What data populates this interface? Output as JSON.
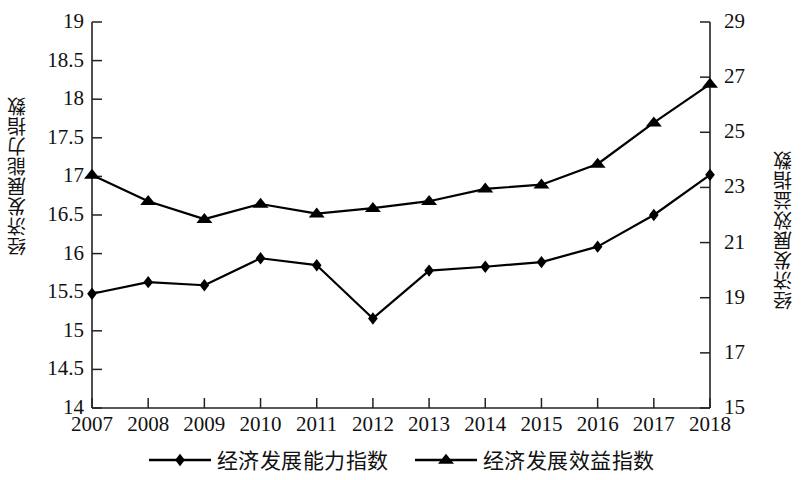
{
  "chart_data": {
    "type": "line",
    "title": "",
    "subtitle": "",
    "xlabel": "",
    "ylabel": "经济发展能力指数",
    "y2label": "经济发展效益指数",
    "grid": false,
    "legend_position": "bottom",
    "categories": [
      "2007",
      "2008",
      "2009",
      "2010",
      "2011",
      "2012",
      "2013",
      "2014",
      "2015",
      "2016",
      "2017",
      "2018"
    ],
    "x": [
      2007,
      2008,
      2009,
      2010,
      2011,
      2012,
      2013,
      2014,
      2015,
      2016,
      2017,
      2018
    ],
    "ylim": [
      14,
      19
    ],
    "yticks": [
      "14",
      "14.5",
      "15",
      "15.5",
      "16",
      "16.5",
      "17",
      "17.5",
      "18",
      "18.5",
      "19"
    ],
    "ytick_values": [
      14,
      14.5,
      15,
      15.5,
      16,
      16.5,
      17,
      17.5,
      18,
      18.5,
      19
    ],
    "y2lim": [
      15,
      29
    ],
    "y2ticks": [
      "15",
      "17",
      "19",
      "21",
      "23",
      "25",
      "27",
      "29"
    ],
    "y2tick_values": [
      15,
      17,
      19,
      21,
      23,
      25,
      27,
      29
    ],
    "series": [
      {
        "name": "经济发展能力指数",
        "axis": "left",
        "marker": "diamond",
        "color": "#000000",
        "values": [
          15.48,
          15.63,
          15.59,
          15.94,
          15.85,
          15.16,
          15.78,
          15.83,
          15.89,
          16.09,
          16.5,
          17.02
        ]
      },
      {
        "name": "经济发展效益指数",
        "axis": "right",
        "marker": "triangle",
        "color": "#000000",
        "values": [
          23.45,
          22.5,
          21.85,
          22.4,
          22.05,
          22.25,
          22.5,
          22.95,
          23.1,
          23.85,
          25.35,
          26.75
        ]
      }
    ],
    "legend": [
      {
        "label": "经济发展能力指数",
        "marker": "diamond"
      },
      {
        "label": "经济发展效益指数",
        "marker": "triangle"
      }
    ]
  }
}
